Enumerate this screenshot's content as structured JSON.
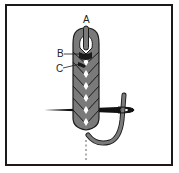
{
  "diagram": {
    "type": "embroidery-stitch-illustration",
    "labels": [
      {
        "id": "A",
        "text": "A"
      },
      {
        "id": "B",
        "text": "B"
      },
      {
        "id": "C",
        "text": "C"
      }
    ],
    "colors": {
      "thread": "#7a7a7a",
      "thread_outline": "#1a1a1a",
      "needle": "#111111",
      "border": "#1a1a1a",
      "background": "#ffffff"
    }
  }
}
